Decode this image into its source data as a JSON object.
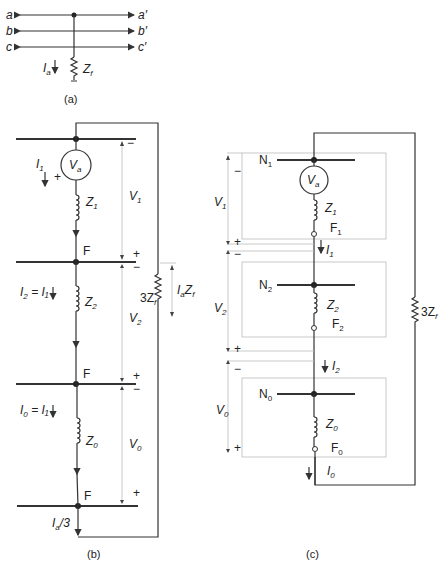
{
  "figure_a": {
    "caption": "(a)",
    "lines": [
      {
        "left": "a",
        "right": "a′"
      },
      {
        "left": "b",
        "right": "b′"
      },
      {
        "left": "c",
        "right": "c′"
      }
    ],
    "current_label": "I",
    "current_sub": "a",
    "impedance_label": "Z",
    "impedance_sub": "f"
  },
  "figure_b": {
    "caption": "(b)",
    "source_label": "V",
    "source_sub": "a",
    "currents": [
      {
        "text": "I",
        "sub": "1",
        "suffix": ""
      },
      {
        "text": "I",
        "sub": "2",
        "suffix": " = I₁"
      },
      {
        "text": "I",
        "sub": "0",
        "suffix": " = I₁"
      }
    ],
    "impedances": [
      {
        "text": "Z",
        "sub": "1"
      },
      {
        "text": "Z",
        "sub": "2"
      },
      {
        "text": "Z",
        "sub": "0"
      }
    ],
    "voltages": [
      {
        "text": "V",
        "sub": "1"
      },
      {
        "text": "V",
        "sub": "2"
      },
      {
        "text": "V",
        "sub": "0"
      }
    ],
    "node_label": "F",
    "fault_impedance": "3Z",
    "fault_impedance_sub": "f",
    "fault_voltage": "I",
    "fault_voltage_sub": "a",
    "fault_voltage_suffix": "Z",
    "fault_voltage_suffix_sub": "f",
    "bottom_current": "I",
    "bottom_current_sub": "a",
    "bottom_current_suffix": "/3",
    "plus": "+",
    "minus": "−"
  },
  "figure_c": {
    "caption": "(c)",
    "networks": [
      {
        "neutral": "N",
        "neutral_sub": "1",
        "impedance": "Z",
        "impedance_sub": "1",
        "fault": "F",
        "fault_sub": "1",
        "has_source": true,
        "voltage": "V",
        "voltage_sub": "1",
        "current": "I",
        "current_sub": "1"
      },
      {
        "neutral": "N",
        "neutral_sub": "2",
        "impedance": "Z",
        "impedance_sub": "2",
        "fault": "F",
        "fault_sub": "2",
        "has_source": false,
        "voltage": "V",
        "voltage_sub": "2",
        "current": "I",
        "current_sub": "2"
      },
      {
        "neutral": "N",
        "neutral_sub": "0",
        "impedance": "Z",
        "impedance_sub": "0",
        "fault": "F",
        "fault_sub": "0",
        "has_source": false,
        "voltage": "V",
        "voltage_sub": "0",
        "current": "I",
        "current_sub": "0"
      }
    ],
    "source_label": "V",
    "source_sub": "a",
    "fault_impedance": "3Z",
    "fault_impedance_sub": "f",
    "plus": "+",
    "minus": "−"
  }
}
